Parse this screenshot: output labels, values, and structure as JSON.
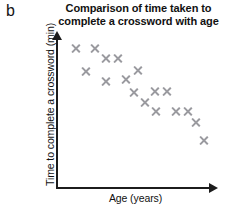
{
  "figure": {
    "letter": "b"
  },
  "chart_data": {
    "type": "scatter",
    "title": "Comparison of time taken to complete a crossword with age",
    "title_lines": [
      "Comparison of time taken to",
      "complete a crossword with age"
    ],
    "xlabel": "Age (years)",
    "ylabel": "Time to complete a crossword (min)",
    "grid": false,
    "legend": null,
    "xticklabels": [],
    "yticklabels": [],
    "marker": "x",
    "marker_color": "#9a9a9f",
    "axis_color": "#1c1c1c",
    "axis_style": "arrow",
    "relationship": "negative",
    "note": "No numeric tick labels are printed on either axis; point values are read as relative pixel positions within the plotting frame.",
    "points_px": [
      {
        "x": 76,
        "y": 48
      },
      {
        "x": 95,
        "y": 48
      },
      {
        "x": 106,
        "y": 58
      },
      {
        "x": 118,
        "y": 58
      },
      {
        "x": 86,
        "y": 71
      },
      {
        "x": 106,
        "y": 81
      },
      {
        "x": 126,
        "y": 79
      },
      {
        "x": 138,
        "y": 70
      },
      {
        "x": 134,
        "y": 92
      },
      {
        "x": 155,
        "y": 91
      },
      {
        "x": 167,
        "y": 91
      },
      {
        "x": 145,
        "y": 102
      },
      {
        "x": 156,
        "y": 111
      },
      {
        "x": 176,
        "y": 111
      },
      {
        "x": 188,
        "y": 111
      },
      {
        "x": 196,
        "y": 122
      },
      {
        "x": 204,
        "y": 140
      }
    ],
    "points_normalized": [
      {
        "x": 0.12,
        "y": 0.93
      },
      {
        "x": 0.24,
        "y": 0.93
      },
      {
        "x": 0.3,
        "y": 0.87
      },
      {
        "x": 0.38,
        "y": 0.87
      },
      {
        "x": 0.18,
        "y": 0.78
      },
      {
        "x": 0.3,
        "y": 0.71
      },
      {
        "x": 0.43,
        "y": 0.72
      },
      {
        "x": 0.5,
        "y": 0.78
      },
      {
        "x": 0.48,
        "y": 0.64
      },
      {
        "x": 0.61,
        "y": 0.64
      },
      {
        "x": 0.68,
        "y": 0.64
      },
      {
        "x": 0.55,
        "y": 0.57
      },
      {
        "x": 0.61,
        "y": 0.51
      },
      {
        "x": 0.74,
        "y": 0.51
      },
      {
        "x": 0.81,
        "y": 0.51
      },
      {
        "x": 0.86,
        "y": 0.43
      },
      {
        "x": 0.91,
        "y": 0.31
      }
    ],
    "n_points": 17
  }
}
